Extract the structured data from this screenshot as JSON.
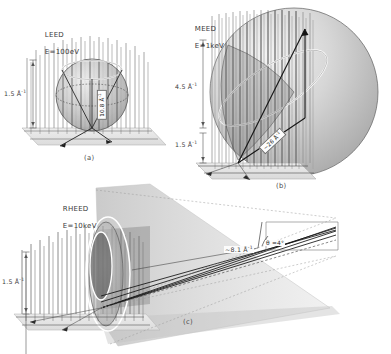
{
  "figure": {
    "panels": [
      {
        "id": "a",
        "caption": "(a)",
        "technique": "LEED",
        "energy": "E=100eV",
        "header": "LEED\nE=100eV",
        "axis_label": "1.5 Å",
        "axis_exponent": "-1",
        "k_label": "10.8 Å",
        "k_exponent": "-1",
        "rod_count": 34,
        "sphere_radius_px": 36
      },
      {
        "id": "b",
        "caption": "(b)",
        "technique": "MEED",
        "energy": "E=1keV",
        "header": "MEED\nE=1keV",
        "axis_label_upper": "4.5 Å",
        "axis_label_upper_exponent": "-1",
        "axis_label_lower": "1.5 Å",
        "axis_label_lower_exponent": "-1",
        "k_label": "~26 Å",
        "k_exponent": "-1",
        "rod_count": 34,
        "sphere_radius_px": 84
      },
      {
        "id": "c",
        "caption": "(c)",
        "technique": "RHEED",
        "energy": "E=10keV",
        "header": "RHEED\nE=10keV",
        "axis_label": "1.5 Å",
        "axis_exponent": "-1",
        "k_label": "~8.1 Å",
        "k_exponent": "-1",
        "angle_label": "θ =4°",
        "rod_count": 26
      }
    ]
  },
  "colors": {
    "ink": "#2b2b2b",
    "rod": "#6b6b6b",
    "rod_dark": "#3c3c3c",
    "sphere_fill": "#c9c9c9",
    "sphere_edge": "#5a5a5a",
    "highlight": "#ffffff",
    "base_plane": "#d8d8d8",
    "beam": "#1a1a1a",
    "cone": "#bdbdbd",
    "background": "#ffffff"
  }
}
